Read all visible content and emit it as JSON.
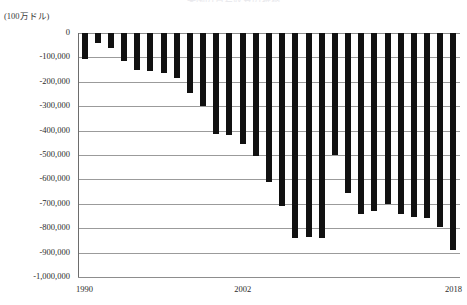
{
  "chart_data": {
    "type": "bar",
    "title": "米国の貿易収支の推移",
    "unit_label": "(100万ドル)",
    "xlabel": "",
    "ylabel": "",
    "ylim": [
      -1000000,
      0
    ],
    "ytick_step": 100000,
    "grid": true,
    "legend": "none",
    "bar_color": "#111111",
    "grid_color": "#9b9b9b",
    "ytick_labels": [
      "0",
      "-100,000",
      "-200,000",
      "-300,000",
      "-400,000",
      "-500,000",
      "-600,000",
      "-700,000",
      "-800,000",
      "-900,000",
      "-1,000,000"
    ],
    "ytick_values": [
      0,
      -100000,
      -200000,
      -300000,
      -400000,
      -500000,
      -600000,
      -700000,
      -800000,
      -900000,
      -1000000
    ],
    "xtick_labels": [
      "1990",
      "2002",
      "2018"
    ],
    "xtick_categories": [
      "1990",
      "2002",
      "2018"
    ],
    "categories": [
      "1990",
      "1991",
      "1992",
      "1993",
      "1994",
      "1995",
      "1996",
      "1997",
      "1998",
      "1999",
      "2000",
      "2001",
      "2002",
      "2003",
      "2004",
      "2005",
      "2006",
      "2007",
      "2008",
      "2009",
      "2010",
      "2011",
      "2012",
      "2013",
      "2014",
      "2015",
      "2016",
      "2017",
      "2018"
    ],
    "values": [
      -111037,
      -31135,
      -39212,
      -70311,
      -98493,
      -96384,
      -104065,
      -108273,
      -166140,
      -258617,
      -372517,
      -361511,
      -418955,
      -493890,
      -609883,
      -714245,
      -761716,
      -705375,
      -708726,
      -383774,
      -494658,
      -548625,
      -536773,
      -461875,
      -490176,
      -500361,
      -504792,
      -552296,
      -627686
    ],
    "bar_top_values": [
      -111037,
      -31135,
      -39212,
      -70311,
      -98493,
      -96384,
      -104065,
      -108273,
      -166140,
      -258617,
      -372517,
      -361511,
      -418955,
      -493890,
      -609883,
      -714245,
      -761716,
      -705375,
      -708726,
      -383774,
      -494658,
      -548625,
      -536773,
      -461875,
      -490176,
      -500361,
      -504792,
      -552296,
      -627686
    ],
    "plot_values": [
      -105000,
      -40000,
      -60000,
      -115000,
      -150000,
      -155000,
      -165000,
      -185000,
      -245000,
      -300000,
      -415000,
      -420000,
      -455000,
      -505000,
      -610000,
      -710000,
      -840000,
      -835000,
      -840000,
      -500000,
      -655000,
      -740000,
      -730000,
      -700000,
      -740000,
      -755000,
      -760000,
      -795000,
      -890000
    ],
    "n_bars": 29,
    "first_year": 1990,
    "last_year": 2018,
    "deepest_value": -890000,
    "deepest_year": "2018"
  }
}
